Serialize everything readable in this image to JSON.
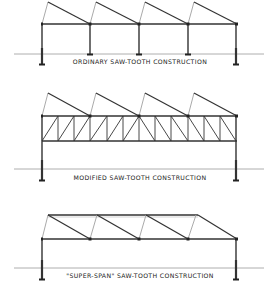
{
  "figure": {
    "background": "#ffffff",
    "line_color": "#333333",
    "ground_color": "#999999",
    "panels": [
      {
        "id": "ordinary",
        "label": "ORDINARY SAW-TOOTH CONSTRUCTION",
        "bays": 4,
        "columns": 5
      },
      {
        "id": "modified",
        "label": "MODIFIED SAW-TOOTH CONSTRUCTION",
        "bays": 4,
        "columns": 2,
        "truss_panels": 12
      },
      {
        "id": "super-span",
        "label": "\"SUPER-SPAN\" SAW-TOOTH CONSTRUCTION",
        "bays": 4,
        "columns": 2
      }
    ]
  }
}
